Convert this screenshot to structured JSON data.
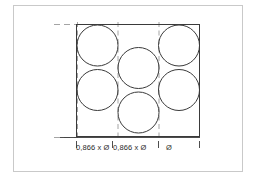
{
  "figure": {
    "background_color": "#ffffff",
    "frame_color": "#c9c9c9",
    "line_color": "#3a3a3a",
    "dashed_color": "#9a9a9a",
    "circle_color": "#3a3a3a",
    "text_color": "#2b2b2b"
  },
  "dimensions": {
    "labels": [
      {
        "id": "dim-1",
        "text": "0,866 x Ø"
      },
      {
        "id": "dim-2",
        "text": "0,866 x Ø"
      },
      {
        "id": "dim-3",
        "text": "Ø"
      }
    ],
    "diameter_symbol": "Ø",
    "factor": "0,866"
  },
  "geometry": {
    "outer_frame": {
      "x": 13,
      "y": 5,
      "width": 230,
      "height": 167
    },
    "rectangle": {
      "x": 76,
      "y": 24,
      "width": 124,
      "height": 113
    },
    "circle_radius": 20.5,
    "circles": [
      {
        "id": "circle-top-left",
        "cx": 97.5,
        "cy": 45.5
      },
      {
        "id": "circle-top-right",
        "cx": 179.0,
        "cy": 45.5
      },
      {
        "id": "circle-middle",
        "cx": 138.5,
        "cy": 68.0
      },
      {
        "id": "circle-bottom-left",
        "cx": 97.5,
        "cy": 90.0
      },
      {
        "id": "circle-bottom-right",
        "cx": 179.0,
        "cy": 90.0
      },
      {
        "id": "circle-lower-mid",
        "cx": 138.5,
        "cy": 112.5
      }
    ],
    "dashed_vertical_lines": [
      77.5,
      118.0,
      159.0
    ],
    "dashed_horizontal_lines": [
      24,
      137
    ],
    "dim_line_y": 137,
    "dim_ticks": [
      76,
      113,
      158,
      200
    ]
  }
}
